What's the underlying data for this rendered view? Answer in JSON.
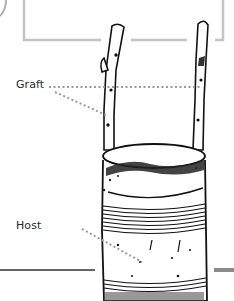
{
  "diagram": {
    "labels": {
      "graft": "Graft",
      "host": "Host"
    },
    "colors": {
      "frame": "#c4c4c4",
      "ink": "#111111",
      "leader": "#9a9a9a",
      "rule": "#333333",
      "rule_right": "#8a8a8a",
      "label_text": "#2a2a2a"
    }
  }
}
